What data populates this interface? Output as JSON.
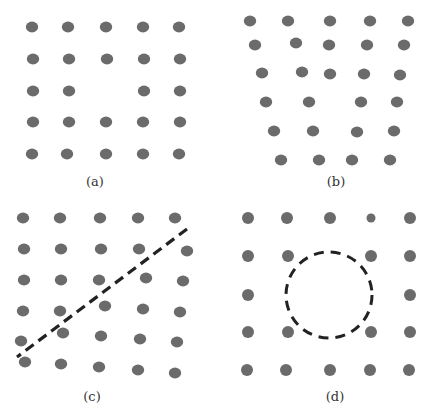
{
  "figure": {
    "dot_color": "#6b6b6b",
    "line_color": "#222222",
    "panels": [
      {
        "id": "a",
        "label": "(a)",
        "label_pos": [
          95,
          181
        ],
        "dot_shape": "ellipse",
        "description": "5x5 grid of dots with the center dot missing",
        "dots": [
          [
            32,
            27
          ],
          [
            68,
            27
          ],
          [
            106,
            27
          ],
          [
            143,
            27
          ],
          [
            179,
            27
          ],
          [
            33,
            59
          ],
          [
            69,
            59
          ],
          [
            107,
            59
          ],
          [
            144,
            59
          ],
          [
            180,
            59
          ],
          [
            33,
            91
          ],
          [
            69,
            91
          ],
          [
            144,
            91
          ],
          [
            180,
            91
          ],
          [
            33,
            122
          ],
          [
            69,
            122
          ],
          [
            106,
            122
          ],
          [
            143,
            122
          ],
          [
            180,
            122
          ],
          [
            32,
            154
          ],
          [
            67,
            154
          ],
          [
            106,
            154
          ],
          [
            143,
            154
          ],
          [
            179,
            154
          ]
        ]
      },
      {
        "id": "b",
        "label": "(b)",
        "label_pos": [
          336,
          181
        ],
        "dot_shape": "ellipse",
        "description": "Trapezoid-shaped arrangement of dots narrowing toward the bottom, rows of 5,5,5,4,4,4",
        "dots": [
          [
            250,
            21
          ],
          [
            288,
            21
          ],
          [
            330,
            21
          ],
          [
            370,
            21
          ],
          [
            408,
            21
          ],
          [
            255,
            45
          ],
          [
            296,
            43
          ],
          [
            329,
            45
          ],
          [
            367,
            45
          ],
          [
            404,
            45
          ],
          [
            262,
            73
          ],
          [
            302,
            72
          ],
          [
            330,
            74
          ],
          [
            364,
            74
          ],
          [
            400,
            75
          ],
          [
            266,
            102
          ],
          [
            309,
            102
          ],
          [
            361,
            102
          ],
          [
            397,
            102
          ],
          [
            274,
            131
          ],
          [
            313,
            131
          ],
          [
            357,
            132
          ],
          [
            394,
            131
          ],
          [
            281,
            160
          ],
          [
            319,
            160
          ],
          [
            352,
            160
          ],
          [
            390,
            160
          ]
        ]
      },
      {
        "id": "c",
        "label": "(c)",
        "label_pos": [
          92,
          396
        ],
        "dot_shape": "ellipse",
        "description": "6x5 grid of dots split by a dashed diagonal; dots below the line are shifted",
        "dots": [
          [
            23,
            218
          ],
          [
            60,
            218
          ],
          [
            100,
            218
          ],
          [
            138,
            218
          ],
          [
            175,
            218
          ],
          [
            24,
            249
          ],
          [
            61,
            249
          ],
          [
            101,
            249
          ],
          [
            139,
            249
          ],
          [
            187,
            251
          ],
          [
            24,
            280
          ],
          [
            61,
            280
          ],
          [
            99,
            280
          ],
          [
            146,
            278
          ],
          [
            183,
            281
          ],
          [
            23,
            311
          ],
          [
            60,
            311
          ],
          [
            105,
            306
          ],
          [
            143,
            309
          ],
          [
            180,
            312
          ],
          [
            21,
            341
          ],
          [
            63,
            333
          ],
          [
            101,
            336
          ],
          [
            140,
            339
          ],
          [
            177,
            342
          ],
          [
            25,
            362
          ],
          [
            61,
            364
          ],
          [
            99,
            367
          ],
          [
            138,
            370
          ],
          [
            175,
            373
          ]
        ],
        "dashed_line": {
          "x1": 187,
          "y1": 229,
          "x2": 17,
          "y2": 357
        }
      },
      {
        "id": "d",
        "label": "(d)",
        "label_pos": [
          335,
          396
        ],
        "dot_shape": "circle",
        "description": "5x5 grid of dots with a plus-shaped gap at the center enclosed by a dashed circle; one smaller dot in the top row",
        "dots": [
          [
            248,
            218,
            6
          ],
          [
            287,
            218,
            6
          ],
          [
            330,
            218,
            6
          ],
          [
            371,
            218,
            4.5
          ],
          [
            410,
            218,
            6
          ],
          [
            248,
            256,
            6
          ],
          [
            288,
            256,
            6
          ],
          [
            371,
            256,
            6
          ],
          [
            410,
            256,
            6
          ],
          [
            248,
            295,
            6
          ],
          [
            410,
            295,
            6
          ],
          [
            248,
            332,
            6
          ],
          [
            288,
            332,
            6
          ],
          [
            371,
            332,
            6
          ],
          [
            410,
            332,
            6
          ],
          [
            247,
            370,
            6
          ],
          [
            286,
            370,
            6
          ],
          [
            330,
            370,
            6
          ],
          [
            370,
            370,
            6
          ],
          [
            409,
            370,
            6
          ]
        ],
        "dashed_circle": {
          "cx": 329,
          "cy": 295,
          "r": 43
        }
      }
    ]
  }
}
